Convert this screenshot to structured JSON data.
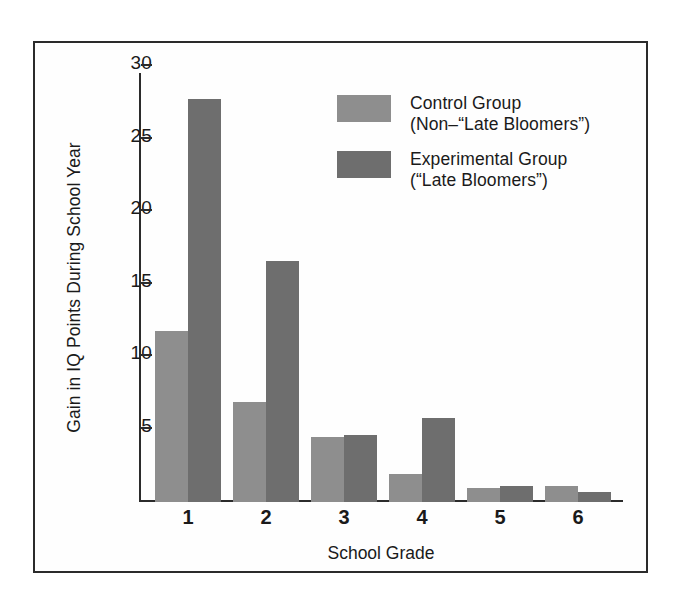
{
  "chart_data": {
    "type": "bar",
    "title": "",
    "xlabel": "School Grade",
    "ylabel": "Gain in IQ Points During School Year",
    "categories": [
      "1",
      "2",
      "3",
      "4",
      "5",
      "6"
    ],
    "ylim": [
      0,
      30
    ],
    "y_ticks": [
      5,
      10,
      15,
      20,
      25,
      30
    ],
    "grid": false,
    "legend_position": "upper-right-inside",
    "series": [
      {
        "name": "Control Group",
        "name_line2": "(Non-–\"Late Bloomers\")",
        "color": "#8e8e8e",
        "values": [
          11.8,
          6.9,
          4.5,
          1.9,
          1.0,
          1.1
        ]
      },
      {
        "name": "Experimental Group",
        "name_line2": "(\"Late Bloomers\")",
        "color": "#6e6e6e",
        "values": [
          27.8,
          16.6,
          4.6,
          5.8,
          1.1,
          0.7
        ]
      }
    ]
  },
  "axes": {
    "y_tick_labels": [
      "30",
      "25",
      "20",
      "15",
      "10",
      "5"
    ],
    "x_tick_labels": [
      "1",
      "2",
      "3",
      "4",
      "5",
      "6"
    ],
    "y_title": "Gain in IQ Points During School Year",
    "x_title": "School Grade"
  },
  "legend": {
    "items": [
      {
        "swatch_color": "#8e8e8e",
        "line1": "Control Group",
        "line2": "(Non–“Late Bloomers”)"
      },
      {
        "swatch_color": "#6e6e6e",
        "line1": "Experimental Group",
        "line2": "(“Late Bloomers”)"
      }
    ]
  },
  "style": {
    "frame_color": "#2b2b2b",
    "background": "#ffffff",
    "text_color": "#1a1a1a"
  }
}
